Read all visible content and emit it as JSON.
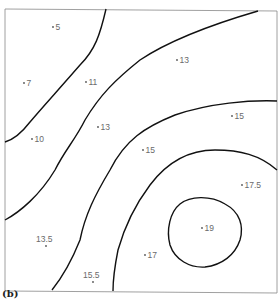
{
  "caption": "(b)",
  "chart_data": {
    "type": "contour",
    "title": "",
    "grid": false,
    "frame": {
      "left": 5,
      "top": 9,
      "right": 277,
      "bottom": 292
    },
    "points": [
      {
        "label": "5",
        "value": 5,
        "x": 53,
        "y": 30
      },
      {
        "label": "7",
        "value": 7,
        "x": 24,
        "y": 86
      },
      {
        "label": "11",
        "value": 11,
        "x": 86,
        "y": 85
      },
      {
        "label": "13",
        "value": 13,
        "x": 177,
        "y": 63
      },
      {
        "label": "10",
        "value": 10,
        "x": 32,
        "y": 142
      },
      {
        "label": "13",
        "value": 13,
        "x": 98,
        "y": 130
      },
      {
        "label": "15",
        "value": 15,
        "x": 143,
        "y": 153
      },
      {
        "label": "15",
        "value": 15,
        "x": 232,
        "y": 119
      },
      {
        "label": "17.5",
        "value": 17.5,
        "x": 242,
        "y": 188
      },
      {
        "label": "19",
        "value": 19,
        "x": 202,
        "y": 231
      },
      {
        "label": "13.5",
        "value": 13.5,
        "x": 46,
        "y": 242
      },
      {
        "label": "15.5",
        "value": 15.5,
        "x": 93,
        "y": 278
      },
      {
        "label": "17",
        "value": 17,
        "x": 145,
        "y": 258
      }
    ],
    "contours": [
      {
        "name": "contour-1",
        "path": "M106,9 C100,35 95,50 80,65 C60,88 40,110 30,122 C20,135 12,140 5,142"
      },
      {
        "name": "contour-2",
        "path": "M258,11 C210,25 170,40 140,60 C115,80 100,95 85,120 C75,140 65,150 55,170 C40,195 20,212 5,220"
      },
      {
        "name": "contour-3",
        "path": "M277,101 C250,100 210,103 175,115 C145,127 125,140 110,170 C95,195 85,215 80,240 C70,265 60,280 52,290"
      },
      {
        "name": "contour-4",
        "path": "M277,170 C260,155 240,150 215,150 C185,150 165,165 150,185 C135,205 125,225 118,250 C114,270 113,280 113,291"
      },
      {
        "name": "contour-5-closed",
        "path": "M180,204 C190,196 210,195 225,204 C240,212 244,226 240,240 C235,255 222,265 205,267 C190,268 175,260 170,245 C166,230 170,212 180,204 Z"
      }
    ]
  }
}
